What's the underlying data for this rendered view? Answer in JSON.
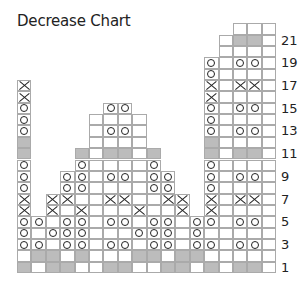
{
  "title": "Decrease Chart",
  "grid": {
    "cols": 18,
    "rows_count": 22,
    "legend_symbols": {
      "": "knit (blank)",
      "o": "purl",
      "x": "decrease (cross)",
      "g": "no stitch (gray)"
    },
    "colors": {
      "gray": "#bcbcbc",
      "line": "#aaaaaa",
      "ink": "#222222"
    },
    "rows": [
      {
        "n": 1,
        "cells": [
          "g",
          "",
          "g",
          "g",
          "",
          "",
          "g",
          "g",
          "",
          "",
          "g",
          "g",
          "",
          "g",
          "",
          "g",
          "g",
          ""
        ]
      },
      {
        "n": 2,
        "cells": [
          "",
          "g",
          "g",
          "",
          "g",
          "",
          "",
          "",
          "g",
          "g",
          "",
          "g",
          "g",
          "",
          "",
          "",
          "",
          ""
        ]
      },
      {
        "n": 3,
        "cells": [
          "o",
          "o",
          "",
          "o",
          "o",
          "",
          "o",
          "o",
          "",
          "o",
          "o",
          "",
          "o",
          "o",
          "",
          "o",
          "o",
          ""
        ]
      },
      {
        "n": 4,
        "cells": [
          "o",
          "",
          "o",
          "o",
          "o",
          "",
          "",
          "",
          "o",
          "o",
          "o",
          "",
          "o",
          "",
          "",
          "",
          "",
          ""
        ]
      },
      {
        "n": 5,
        "cells": [
          "o",
          "o",
          "",
          "o",
          "o",
          "",
          "o",
          "o",
          "",
          "o",
          "o",
          "",
          "o",
          "o",
          "",
          "o",
          "o",
          ""
        ]
      },
      {
        "n": 6,
        "cells": [
          "x",
          "-",
          "x",
          "",
          "x",
          "",
          "",
          "",
          "x",
          "",
          "",
          "x",
          "-",
          "x",
          "",
          "",
          "",
          ""
        ]
      },
      {
        "n": 7,
        "cells": [
          "x",
          "-",
          "x",
          "x",
          "",
          "",
          "x",
          "x",
          "",
          "",
          "x",
          "x",
          "-",
          "x",
          "",
          "x",
          "x",
          ""
        ]
      },
      {
        "n": 8,
        "cells": [
          "o",
          "-",
          "-",
          "o",
          "o",
          "",
          "",
          "",
          "",
          "o",
          "o",
          "-",
          "-",
          "o",
          "",
          "",
          "",
          ""
        ]
      },
      {
        "n": 9,
        "cells": [
          "o",
          "-",
          "-",
          "o",
          "o",
          "",
          "o",
          "o",
          "",
          "o",
          "o",
          "-",
          "-",
          "o",
          "",
          "o",
          "o",
          ""
        ]
      },
      {
        "n": 10,
        "cells": [
          "o",
          "-",
          "-",
          "-",
          "o",
          "",
          "",
          "",
          "",
          "o",
          "-",
          "-",
          "-",
          "o",
          "",
          "",
          "",
          ""
        ]
      },
      {
        "n": 11,
        "cells": [
          "g",
          "-",
          "-",
          "-",
          "g",
          "",
          "g",
          "g",
          "",
          "g",
          "-",
          "-",
          "-",
          "g",
          "",
          "g",
          "g",
          ""
        ]
      },
      {
        "n": 12,
        "cells": [
          "g",
          "-",
          "-",
          "-",
          "-",
          "",
          "",
          "",
          "",
          "-",
          "-",
          "-",
          "-",
          "g",
          "",
          "",
          "",
          ""
        ]
      },
      {
        "n": 13,
        "cells": [
          "o",
          "-",
          "-",
          "-",
          "-",
          "",
          "o",
          "o",
          "",
          "-",
          "-",
          "-",
          "-",
          "o",
          "",
          "o",
          "o",
          ""
        ]
      },
      {
        "n": 14,
        "cells": [
          "o",
          "-",
          "-",
          "-",
          "-",
          "",
          "",
          "",
          "",
          "-",
          "-",
          "-",
          "-",
          "o",
          "",
          "",
          "",
          ""
        ]
      },
      {
        "n": 15,
        "cells": [
          "o",
          "-",
          "-",
          "-",
          "-",
          "-",
          "o",
          "o",
          "-",
          "-",
          "-",
          "-",
          "-",
          "o",
          "",
          "o",
          "o",
          ""
        ]
      },
      {
        "n": 16,
        "cells": [
          "x",
          "-",
          "-",
          "-",
          "-",
          "-",
          "-",
          "-",
          "-",
          "-",
          "-",
          "-",
          "-",
          "x",
          "",
          "",
          "",
          ""
        ]
      },
      {
        "n": 17,
        "cells": [
          "x",
          "-",
          "-",
          "-",
          "-",
          "-",
          "-",
          "-",
          "-",
          "-",
          "-",
          "-",
          "-",
          "x",
          "",
          "x",
          "x",
          ""
        ]
      },
      {
        "n": 18,
        "cells": [
          "-",
          "-",
          "-",
          "-",
          "-",
          "-",
          "-",
          "-",
          "-",
          "-",
          "-",
          "-",
          "-",
          "o",
          "",
          "",
          "",
          ""
        ]
      },
      {
        "n": 19,
        "cells": [
          "-",
          "-",
          "-",
          "-",
          "-",
          "-",
          "-",
          "-",
          "-",
          "-",
          "-",
          "-",
          "-",
          "o",
          "",
          "o",
          "o",
          ""
        ]
      },
      {
        "n": 20,
        "cells": [
          "-",
          "-",
          "-",
          "-",
          "-",
          "-",
          "-",
          "-",
          "-",
          "-",
          "-",
          "-",
          "-",
          "-",
          "",
          "",
          "",
          ""
        ]
      },
      {
        "n": 21,
        "cells": [
          "-",
          "-",
          "-",
          "-",
          "-",
          "-",
          "-",
          "-",
          "-",
          "-",
          "-",
          "-",
          "-",
          "-",
          "",
          "g",
          "g",
          ""
        ]
      },
      {
        "n": 22,
        "cells": [
          "-",
          "-",
          "-",
          "-",
          "-",
          "-",
          "-",
          "-",
          "-",
          "-",
          "-",
          "-",
          "-",
          "-",
          "-",
          "",
          "",
          ""
        ]
      }
    ]
  },
  "row_labels": [
    "1",
    "3",
    "5",
    "7",
    "9",
    "11",
    "13",
    "15",
    "17",
    "19",
    "21"
  ]
}
